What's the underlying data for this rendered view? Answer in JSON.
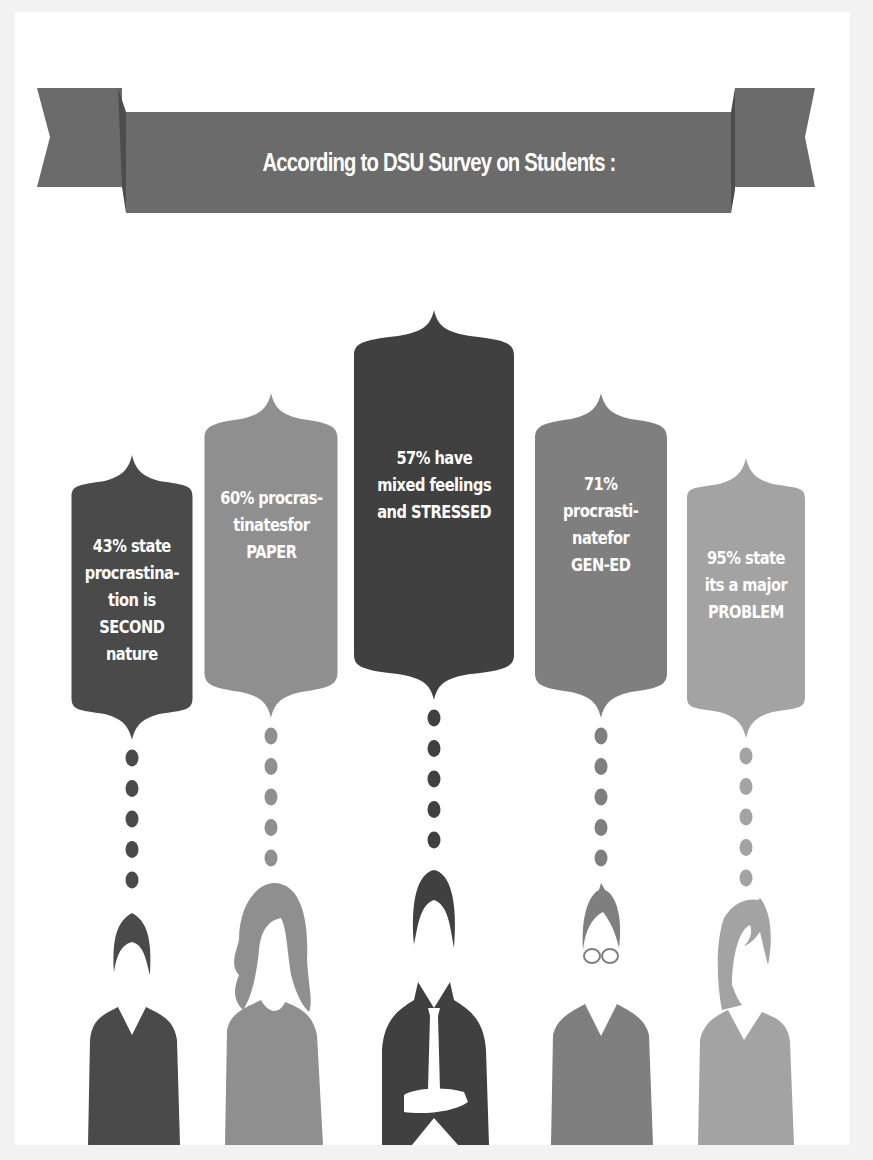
{
  "banner": {
    "title": "According to DSU Survey on Students :",
    "color": "#6b6b6b",
    "fold_color": "#4d4d4d"
  },
  "stats": [
    {
      "percent": "43%",
      "text": "43% state\nprocrastina-\ntion is\nSECOND\nnature",
      "color": "#4a4a4a",
      "person": "man-short-hair",
      "dots": 5
    },
    {
      "percent": "60%",
      "text": "60% procras-\ntinatesfor\nPAPER",
      "color": "#8f8f8f",
      "person": "woman-long-hair",
      "dots": 5
    },
    {
      "percent": "57%",
      "text": "57% have\nmixed feelings\nand STRESSED",
      "color": "#404040",
      "person": "man-suit-tie-arms-crossed",
      "dots": 5
    },
    {
      "percent": "71%",
      "text": "71%\nprocrasti-\nnatefor\nGEN-ED",
      "color": "#7f7f7f",
      "person": "man-glasses",
      "dots": 5
    },
    {
      "percent": "95%",
      "text": "95% state\nits a major\nPROBLEM",
      "color": "#a3a3a3",
      "person": "woman-side-fringe",
      "dots": 5
    }
  ]
}
